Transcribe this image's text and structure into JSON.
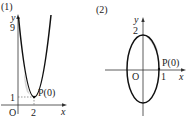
{
  "panels": [
    {
      "label": "(1)",
      "y_axis_label": "y",
      "x_axis_label": "x",
      "origin_label": "O",
      "y_tick_top": "9",
      "y_tick_low": "1",
      "x_tick": "2",
      "point_label": "P(0)",
      "curve": "parabola",
      "vertex": [
        2,
        1
      ],
      "y_intercept": 9
    },
    {
      "label": "(2)",
      "y_axis_label": "y",
      "x_axis_label": "x",
      "origin_label": "O",
      "y_tick_top": "2",
      "x_tick": "1",
      "point_label": "P(0)",
      "curve": "ellipse",
      "semi_axis_x": 1,
      "semi_axis_y": 2
    }
  ],
  "colors": {
    "curve": "#111111",
    "axis": "#333333",
    "shade": "#bbbbbb"
  }
}
